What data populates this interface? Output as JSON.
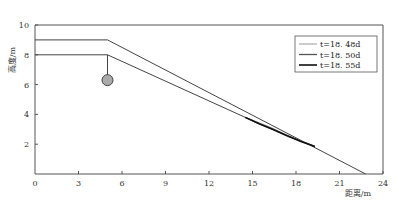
{
  "chart_data": {
    "type": "line",
    "title": "",
    "xlabel": "距离/m",
    "ylabel": "高度/m",
    "xlim": [
      0,
      24
    ],
    "ylim": [
      0,
      10
    ],
    "xticks": [
      0,
      3,
      6,
      9,
      12,
      15,
      18,
      21,
      24
    ],
    "yticks": [
      2,
      4,
      6,
      8,
      10
    ],
    "grid": false,
    "legend_position": "top-right",
    "profile_lines": [
      {
        "name": "slope-surface",
        "x": [
          0,
          5,
          22.8
        ],
        "y": [
          9,
          9,
          0
        ]
      },
      {
        "name": "slip-surface",
        "x": [
          0,
          5,
          14.5
        ],
        "y": [
          8,
          8,
          3.8
        ]
      }
    ],
    "anchor": {
      "x": 5,
      "y_top": 8,
      "y_bottom": 6.6,
      "ball_center": [
        5,
        6.3
      ]
    },
    "series": [
      {
        "name": "t=18. 48d",
        "color": "#9a9a9a",
        "x": [
          14.5,
          15.3,
          16.2,
          17.2,
          18.2,
          19.3
        ],
        "y": [
          3.8,
          3.5,
          3.15,
          2.7,
          2.25,
          1.85
        ]
      },
      {
        "name": "t=18. 50d",
        "color": "#555555",
        "x": [
          14.5,
          15.4,
          16.3,
          17.2,
          18.2,
          19.3
        ],
        "y": [
          3.8,
          3.4,
          3.05,
          2.65,
          2.25,
          1.85
        ]
      },
      {
        "name": "t=18. 55d",
        "color": "#111111",
        "x": [
          14.5,
          15.5,
          16.5,
          17.3,
          18.3,
          19.3
        ],
        "y": [
          3.8,
          3.35,
          2.95,
          2.6,
          2.2,
          1.85
        ]
      }
    ]
  }
}
